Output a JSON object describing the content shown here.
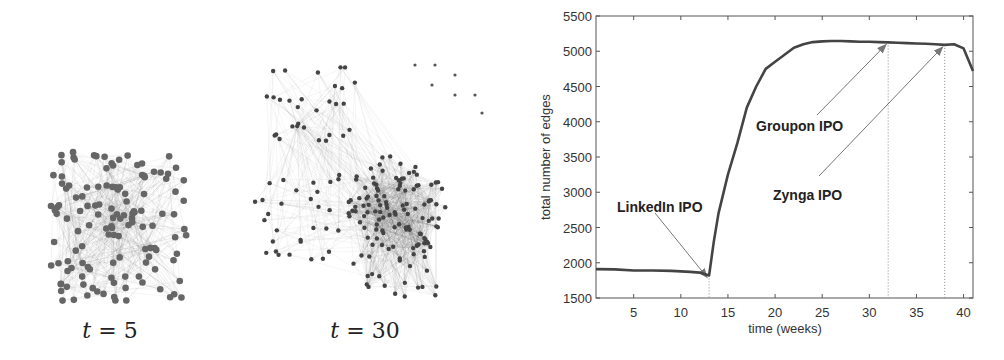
{
  "networks": [
    {
      "caption_var": "t",
      "caption_eq": "=",
      "caption_val": "5",
      "label": "t = 5"
    },
    {
      "caption_var": "t",
      "caption_eq": "=",
      "caption_val": "30",
      "label": "t = 30"
    }
  ],
  "chart_data": {
    "type": "line",
    "title": "",
    "xlabel": "time (weeks)",
    "ylabel": "total number of edges",
    "xlim": [
      1,
      41
    ],
    "ylim": [
      1500,
      5500
    ],
    "xticks": [
      5,
      10,
      15,
      20,
      25,
      30,
      35,
      40
    ],
    "yticks": [
      1500,
      2000,
      2500,
      3000,
      3500,
      4000,
      4500,
      5000,
      5500
    ],
    "grid": false,
    "legend": null,
    "series": [
      {
        "name": "total number of edges",
        "x": [
          1,
          3,
          5,
          7,
          9,
          11,
          12,
          13,
          13.5,
          14,
          15,
          16,
          17,
          18,
          19,
          20,
          21,
          22,
          23,
          24,
          25,
          26,
          27,
          28,
          29,
          30,
          31,
          32,
          33,
          34,
          35,
          36,
          37,
          38,
          39,
          40,
          41
        ],
        "y": [
          1910,
          1905,
          1890,
          1890,
          1885,
          1870,
          1860,
          1820,
          2300,
          2700,
          3250,
          3700,
          4200,
          4500,
          4750,
          4850,
          4950,
          5050,
          5100,
          5130,
          5140,
          5145,
          5145,
          5140,
          5135,
          5135,
          5130,
          5125,
          5120,
          5115,
          5110,
          5105,
          5100,
          5090,
          5100,
          5040,
          4720
        ]
      }
    ],
    "annotations": [
      {
        "text": "LinkedIn IPO",
        "x": 13,
        "y": 1820,
        "vline": 13
      },
      {
        "text": "Groupon IPO",
        "x": 32,
        "y": 5125,
        "vline": 32
      },
      {
        "text": "Zynga IPO",
        "x": 38,
        "y": 5090,
        "vline": 38
      }
    ]
  }
}
